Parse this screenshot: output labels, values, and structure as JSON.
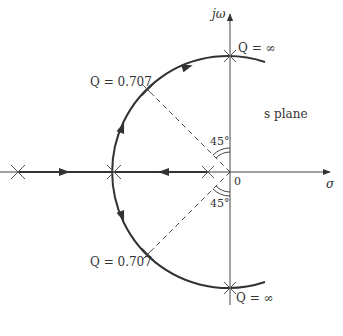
{
  "diagram": {
    "title": "s plane",
    "axes": {
      "vertical_label": "jω",
      "horizontal_label": "σ",
      "origin_label": "0"
    },
    "annotations": {
      "q_infinity_top": "Q = ∞",
      "q_infinity_bottom": "Q = ∞",
      "q_0707_top": "Q = 0.707",
      "q_0707_bottom": "Q = 0.707",
      "angle_top": "45°",
      "angle_bottom": "45°"
    },
    "colors": {
      "stroke": "#333333",
      "axis": "#444444"
    }
  }
}
